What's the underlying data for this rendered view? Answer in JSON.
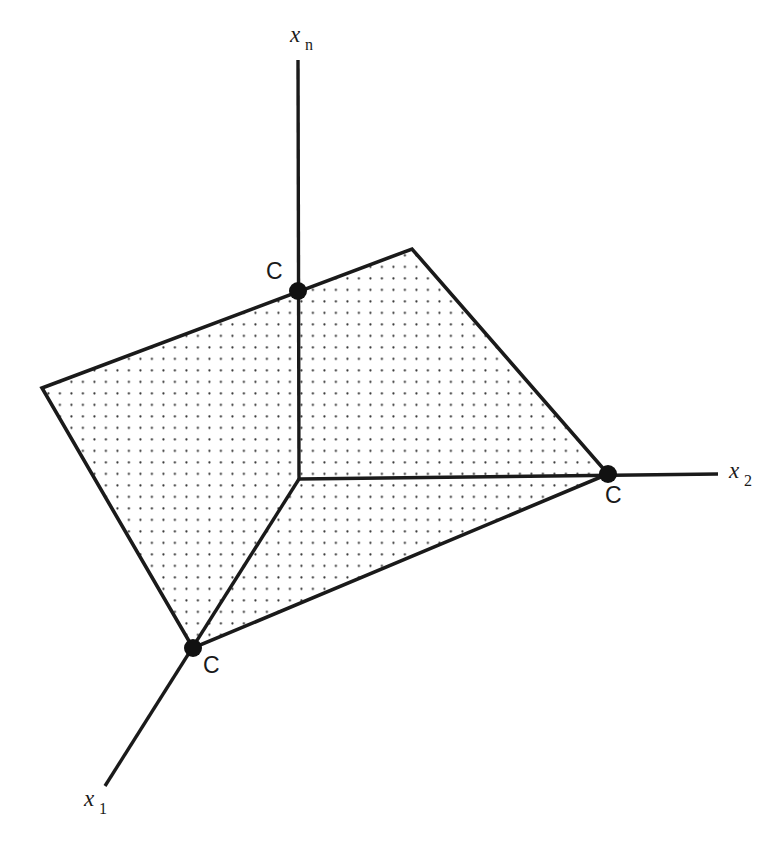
{
  "figure": {
    "background_color": "#ffffff",
    "ink_color": "#1a1a1a",
    "width": 779,
    "height": 841
  },
  "axes": [
    {
      "name": "x-n-axis",
      "base_label": "x",
      "subscript": "n",
      "label_x": 290,
      "label_y": 42,
      "sub_x": 305,
      "sub_y": 50,
      "line": {
        "x1": 298,
        "y1": 60,
        "x2": 299,
        "y2": 479
      }
    },
    {
      "name": "x-2-axis",
      "base_label": "x",
      "subscript": "2",
      "label_x": 729,
      "label_y": 478,
      "sub_x": 744,
      "sub_y": 486,
      "line": {
        "x1": 299,
        "y1": 479,
        "x2": 718,
        "y2": 474
      }
    },
    {
      "name": "x-1-axis",
      "base_label": "x",
      "subscript": "1",
      "label_x": 84,
      "label_y": 806,
      "sub_x": 99,
      "sub_y": 814,
      "line": {
        "x1": 299,
        "y1": 479,
        "x2": 105,
        "y2": 786
      }
    }
  ],
  "region": {
    "name": "feasible-region",
    "fill_pattern": "dot-grid",
    "dot_spacing": 11.5,
    "dot_radius": 1.1,
    "dot_color": "#2b2b2b",
    "stroke_color": "#1a1a1a",
    "stroke_width": 3.6,
    "points": "42,388 412,249 608,474 193,648"
  },
  "vertices": [
    {
      "name": "vertex-c-top",
      "label": "C",
      "cx": 298,
      "cy": 291,
      "r": 9,
      "label_x": 266,
      "label_y": 279
    },
    {
      "name": "vertex-c-right",
      "label": "C",
      "cx": 608,
      "cy": 474,
      "r": 9,
      "label_x": 605,
      "label_y": 503
    },
    {
      "name": "vertex-c-bottom-left",
      "label": "C",
      "cx": 193,
      "cy": 648,
      "r": 9,
      "label_x": 203,
      "label_y": 673
    }
  ],
  "chart_data": {
    "type": "diagram",
    "axis_labels": [
      "x_n",
      "x_2",
      "x_1"
    ],
    "origin": [
      299,
      479
    ],
    "polygon_vertices": [
      [
        42,
        388
      ],
      [
        412,
        249
      ],
      [
        608,
        474
      ],
      [
        193,
        648
      ]
    ],
    "marked_vertices": [
      {
        "label": "C",
        "on_axis": "x_n",
        "position": [
          298,
          291
        ]
      },
      {
        "label": "C",
        "on_axis": "x_2",
        "position": [
          608,
          474
        ]
      },
      {
        "label": "C",
        "on_axis": "x_1",
        "position": [
          193,
          648
        ]
      }
    ]
  }
}
